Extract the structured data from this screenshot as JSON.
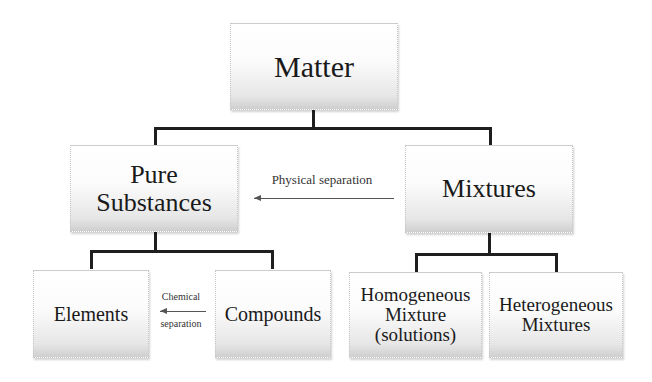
{
  "diagram": {
    "root": {
      "label": "Matter"
    },
    "level1": [
      {
        "label_line1": "Pure",
        "label_line2": "Substances"
      },
      {
        "label": "Mixtures"
      }
    ],
    "pure_children": [
      {
        "label": "Elements"
      },
      {
        "label": "Compounds"
      }
    ],
    "mixture_children": [
      {
        "line1": "Homogeneous",
        "line2": "Mixture",
        "line3": "(solutions)"
      },
      {
        "line1": "Heterogeneous",
        "line2": "Mixtures"
      }
    ],
    "arrows": {
      "physical": {
        "label": "Physical separation"
      },
      "chemical": {
        "label_top": "Chemical",
        "label_bottom": "separation"
      }
    }
  }
}
